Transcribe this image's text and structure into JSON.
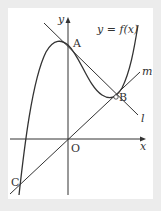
{
  "diagram": {
    "curve_label": "y = f(x)",
    "axis_x_label": "x",
    "axis_y_label": "y",
    "origin_label": "O",
    "points": [
      {
        "name": "A",
        "x": 68,
        "y": 45
      },
      {
        "name": "B",
        "x": 116,
        "y": 97
      },
      {
        "name": "C",
        "x": 20,
        "y": 185
      },
      {
        "name": "O",
        "x": 68,
        "y": 139
      }
    ],
    "lines": [
      {
        "name": "l",
        "description": "tangent to curve at A, passing through B"
      },
      {
        "name": "m",
        "description": "line through O, B and C"
      }
    ],
    "colors": {
      "background": "#ececec",
      "panel": "#ffffff",
      "stroke": "#333333"
    }
  }
}
